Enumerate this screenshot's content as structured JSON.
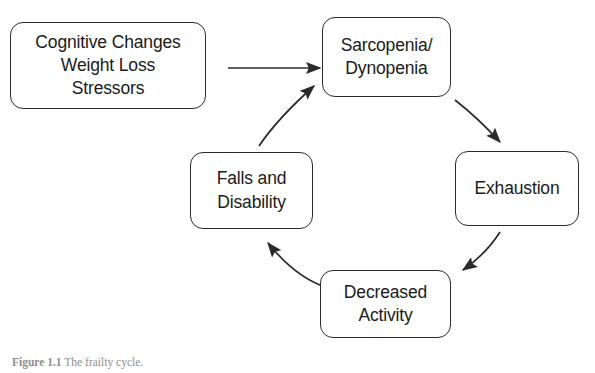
{
  "figure": {
    "background_color": "#ffffff",
    "stroke_color": "#2b2b2b",
    "text_color": "#1a1a1a",
    "caption_label": "Figure 1.1",
    "caption_text": "The frailty cycle.",
    "caption_color": "#8e8e8e"
  },
  "nodes": [
    {
      "id": "cognitive",
      "lines": [
        "Cognitive Changes",
        "Weight Loss",
        "Stressors"
      ]
    },
    {
      "id": "sarcopenia",
      "lines": [
        "Sarcopenia/",
        "Dynopenia"
      ]
    },
    {
      "id": "exhaustion",
      "lines": [
        "Exhaustion"
      ]
    },
    {
      "id": "decreased",
      "lines": [
        "Decreased",
        "Activity"
      ]
    },
    {
      "id": "falls",
      "lines": [
        "Falls and",
        "Disability"
      ]
    }
  ],
  "edges": [
    {
      "id": "cognitive-to-sarcopenia",
      "from": "cognitive",
      "to": "sarcopenia",
      "style": "straight"
    },
    {
      "id": "sarcopenia-to-exhaustion",
      "from": "sarcopenia",
      "to": "exhaustion",
      "style": "curved"
    },
    {
      "id": "exhaustion-to-decreased",
      "from": "exhaustion",
      "to": "decreased",
      "style": "curved"
    },
    {
      "id": "decreased-to-falls",
      "from": "decreased",
      "to": "falls",
      "style": "curved"
    },
    {
      "id": "falls-to-sarcopenia",
      "from": "falls",
      "to": "sarcopenia",
      "style": "curved"
    }
  ]
}
